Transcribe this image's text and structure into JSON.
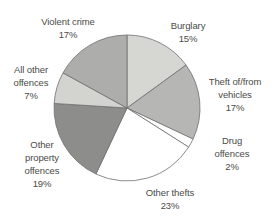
{
  "chart_data": {
    "type": "pie",
    "title": "",
    "unit": "%",
    "total": 100,
    "start_angle_deg": 0,
    "direction": "clockwise",
    "center": [
      127,
      108
    ],
    "radius": 73,
    "stroke_color": "#6e6e6e",
    "background": "#ffffff",
    "text_color": "#4b4b48",
    "legend": "none (labels placed around pie)",
    "slices": [
      {
        "id": "burglary",
        "label": "Burglary",
        "value": 15,
        "pct_label": "15%",
        "color": "#d6d6d3",
        "label_lines": [
          "Burglary"
        ]
      },
      {
        "id": "theft-vehicles",
        "label": "Theft of/from vehicles",
        "value": 17,
        "pct_label": "17%",
        "color": "#b6b6b4",
        "label_lines": [
          "Theft of/from",
          "vehicles"
        ]
      },
      {
        "id": "drug-offences",
        "label": "Drug offences",
        "value": 2,
        "pct_label": "2%",
        "color": "#ffffff",
        "label_lines": [
          "Drug",
          "offences"
        ]
      },
      {
        "id": "other-thefts",
        "label": "Other thefts",
        "value": 23,
        "pct_label": "23%",
        "color": "#ffffff",
        "label_lines": [
          "Other thefts"
        ]
      },
      {
        "id": "other-property",
        "label": "Other property offences",
        "value": 19,
        "pct_label": "19%",
        "color": "#8d8d8b",
        "label_lines": [
          "Other",
          "property",
          "offences"
        ]
      },
      {
        "id": "all-other",
        "label": "All other offences",
        "value": 7,
        "pct_label": "7%",
        "color": "#d3d3d0",
        "label_lines": [
          "All other",
          "offences"
        ]
      },
      {
        "id": "violent-crime",
        "label": "Violent crime",
        "value": 17,
        "pct_label": "17%",
        "color": "#adadab",
        "label_lines": [
          "Violent crime"
        ]
      }
    ]
  }
}
